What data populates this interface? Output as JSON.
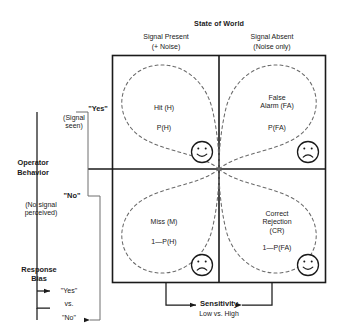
{
  "diagram": {
    "title": "State of World",
    "columns": [
      {
        "line1": "Signal Present",
        "line2": "(+ Noise)"
      },
      {
        "line1": "Signal Absent",
        "line2": "(Noise only)"
      }
    ],
    "row_axis_label": {
      "line1": "Operator",
      "line2": "Behavior"
    },
    "rows": [
      {
        "label_quoted": "\"Yes\"",
        "label_detail": "(Signal\nseen)"
      },
      {
        "label_quoted": "\"No\"",
        "label_detail": "(No signal\nperceived)"
      }
    ],
    "cells": [
      {
        "id": "hit",
        "title": "Hit (H)",
        "probability": "P(H)",
        "face": "smiley-face",
        "face_mood": "happy"
      },
      {
        "id": "false-alarm",
        "title": "False\nAlarm (FA)",
        "probability": "P(FA)",
        "face": "frowny-face",
        "face_mood": "sad"
      },
      {
        "id": "miss",
        "title": "Miss (M)",
        "probability": "1—P(H)",
        "face": "frowny-face",
        "face_mood": "sad"
      },
      {
        "id": "correct-rejection",
        "title": "Correct\nRejection\n(CR)",
        "probability": "1—P(FA)",
        "face": "smiley-face",
        "face_mood": "happy"
      }
    ],
    "sensitivity": {
      "label": "Sensitivity",
      "sublabel": "Low vs. High"
    },
    "response_bias": {
      "label": "Response\nBias",
      "option_a": "\"Yes\"",
      "connector": "vs.",
      "option_b": "\"No\""
    },
    "colors": {
      "stroke": "#1a1a1a",
      "dashed": "#555555",
      "background": "#ffffff"
    }
  }
}
